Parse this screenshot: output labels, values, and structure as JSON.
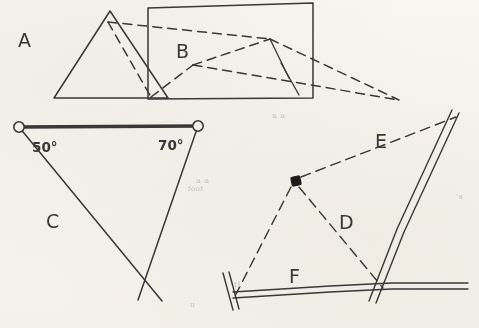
{
  "document": {
    "kind": "hand-drawn-geometry-worksheet-scan",
    "background_color": "#fbfaf7",
    "ink_color": "#3a3a3a",
    "width": 479,
    "height": 328
  },
  "figures": [
    {
      "id": "A",
      "label": "A",
      "label_x": 18,
      "label_y": 47,
      "description": "solid-outline triangle",
      "line_style": "solid",
      "points": "54,98 110,11 168,98 54,98"
    },
    {
      "id": "B",
      "label": "B",
      "label_x": 176,
      "label_y": 58,
      "description": "dashed quadrilateral overlapping a solid quadrilateral panel",
      "line_style": "mixed-solid-and-dashed",
      "solid_points": "148,8 313,3 313,98 148,99 148,8",
      "dashed_paths": [
        "M108,22 L151,97",
        "M108,22 L270,39 L399,100",
        "M151,97 L193,65 L270,39",
        "M193,65 L399,100",
        "M270,39 L289,78"
      ]
    },
    {
      "id": "C",
      "label": "C",
      "label_x": 46,
      "label_y": 228,
      "description": "triangle with two marked base nodes and two interior angle measures",
      "line_style": "solid",
      "baseline": {
        "x1": 19,
        "y1": 127,
        "x2": 198,
        "y2": 126,
        "thick": true
      },
      "nodes": [
        {
          "name": "left-node",
          "cx": 19,
          "cy": 127,
          "r": 5
        },
        {
          "name": "right-node",
          "cx": 198,
          "cy": 126,
          "r": 5
        }
      ],
      "rays": [
        "M19,127 L160,299",
        "M198,126 L140,298"
      ],
      "angles": [
        {
          "value": "50°",
          "x": 32,
          "y": 152
        },
        {
          "value": "70°",
          "x": 158,
          "y": 150
        }
      ]
    },
    {
      "id": "D",
      "label": "D",
      "label_x": 339,
      "label_y": 229,
      "description": "dashed sight-line from station marker down to road intersection"
    },
    {
      "id": "E",
      "label": "E",
      "label_x": 375,
      "label_y": 148,
      "description": "dashed sight-line from station marker up-right to road"
    },
    {
      "id": "F",
      "label": "F",
      "label_x": 289,
      "label_y": 283,
      "description": "dashed sight-line from station marker down-left to road end marker"
    }
  ],
  "station_marker": {
    "name": "station-point",
    "shape": "filled-square",
    "x": 296,
    "y": 181,
    "size": 9,
    "color": "#1c1c1c"
  },
  "road_network": {
    "style": "double-line",
    "roads": [
      {
        "name": "horizontal-road",
        "path": "M231,294 L330,288 L390,285 L467,285"
      },
      {
        "name": "diagonal-road",
        "path": "M455,112 L400,230 L372,300"
      },
      {
        "name": "end-marker-bar",
        "path": "M225,275 L237,311"
      }
    ],
    "intersection": {
      "x": 383,
      "y": 287
    }
  },
  "sight_lines": [
    {
      "name": "sight-line-E",
      "from": "station-point",
      "path": "M300,178 L455,118"
    },
    {
      "name": "sight-line-D",
      "from": "station-point",
      "path": "M299,186 L383,288"
    },
    {
      "name": "sight-line-F",
      "from": "station-point",
      "path": "M292,187 L236,297"
    }
  ],
  "ghost_text": [
    {
      "text": "a a",
      "x": 196,
      "y": 186
    },
    {
      "text": "a a",
      "x": 272,
      "y": 120
    },
    {
      "text": "foot",
      "x": 188,
      "y": 192
    },
    {
      "text": "'s",
      "x": 456,
      "y": 200
    },
    {
      "text": "u",
      "x": 190,
      "y": 308
    },
    {
      "text": "tl",
      "x": 234,
      "y": 288
    }
  ]
}
